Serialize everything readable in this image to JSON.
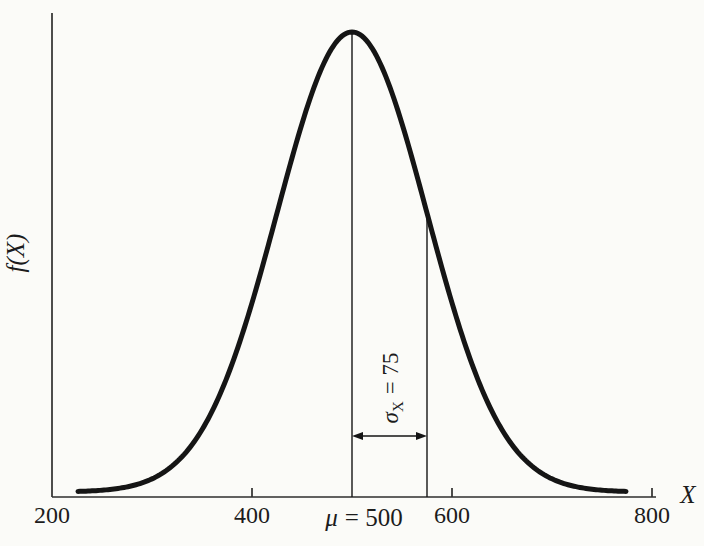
{
  "figure": {
    "background_color": "#fbfbf8",
    "curve_color": "#151515",
    "axis_color": "#2e2e2e"
  },
  "chart_data": {
    "type": "line",
    "title": "",
    "xlabel": "X",
    "ylabel": "f(X)",
    "xlim": [
      200,
      800
    ],
    "grid": false,
    "legend": "none",
    "x_ticks": [
      {
        "value": 200,
        "label": "200"
      },
      {
        "value": 400,
        "label": "400"
      },
      {
        "value": 600,
        "label": "600"
      },
      {
        "value": 800,
        "label": "800"
      }
    ],
    "tick_marks_at": [
      400,
      600,
      800
    ],
    "distribution": {
      "mean": 500,
      "sigma": 75,
      "curve_x_start": 226,
      "curve_x_end": 774
    },
    "series": [
      {
        "name": "f(X)",
        "x": [
          225,
          250,
          275,
          300,
          325,
          350,
          375,
          400,
          425,
          450,
          475,
          500,
          525,
          550,
          575,
          600,
          625,
          650,
          675,
          700,
          725,
          750,
          775
        ],
        "y_relative": [
          0.0012,
          0.0039,
          0.0111,
          0.0285,
          0.0657,
          0.1353,
          0.2494,
          0.4111,
          0.6065,
          0.8007,
          0.9459,
          1.0,
          0.9459,
          0.8007,
          0.6065,
          0.4111,
          0.2494,
          0.1353,
          0.0657,
          0.0285,
          0.0111,
          0.0039,
          0.0012
        ]
      }
    ],
    "annotations": {
      "mean_symbol": "μ",
      "mean_equals": "= 500",
      "mean_line_at_x": 500,
      "sigma_symbol": "σ",
      "sigma_subscript": "X",
      "sigma_equals": "= 75",
      "sigma_line_at_x": 575,
      "arrow_between_x": [
        500,
        575
      ]
    }
  }
}
